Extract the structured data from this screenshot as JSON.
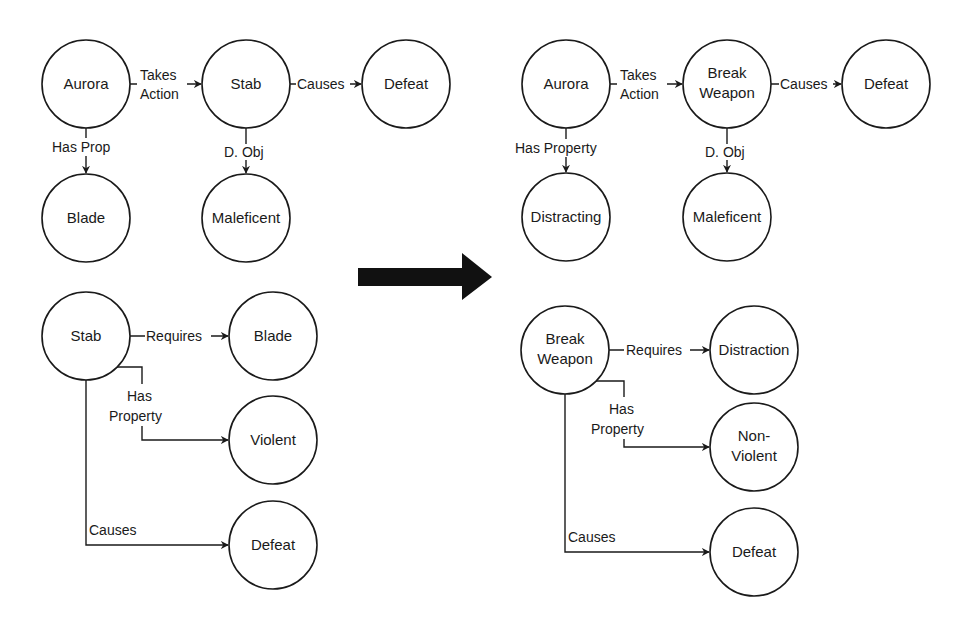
{
  "colors": {
    "stroke": "#1a1a1a",
    "background": "#ffffff",
    "arrow": "#111111"
  },
  "left_top": {
    "nodes": [
      {
        "id": "aurora",
        "label": "Aurora"
      },
      {
        "id": "stab",
        "label": "Stab"
      },
      {
        "id": "defeat",
        "label": "Defeat"
      },
      {
        "id": "blade",
        "label": "Blade"
      },
      {
        "id": "maleficent",
        "label": "Maleficent"
      }
    ],
    "edges": [
      {
        "from": "aurora",
        "to": "stab",
        "label_1": "Takes",
        "label_2": "Action"
      },
      {
        "from": "stab",
        "to": "defeat",
        "label": "Causes"
      },
      {
        "from": "aurora",
        "to": "blade",
        "label": "Has Prop"
      },
      {
        "from": "stab",
        "to": "maleficent",
        "label": "D. Obj"
      }
    ]
  },
  "left_bottom": {
    "nodes": [
      {
        "id": "stab",
        "label": "Stab"
      },
      {
        "id": "blade",
        "label": "Blade"
      },
      {
        "id": "violent",
        "label": "Violent"
      },
      {
        "id": "defeat",
        "label": "Defeat"
      }
    ],
    "edges": [
      {
        "from": "stab",
        "to": "blade",
        "label": "Requires"
      },
      {
        "from": "stab",
        "to": "violent",
        "label_1": "Has",
        "label_2": "Property"
      },
      {
        "from": "stab",
        "to": "defeat",
        "label": "Causes"
      }
    ]
  },
  "transform_arrow": {
    "icon": "right-arrow-icon"
  },
  "right_top": {
    "nodes": [
      {
        "id": "aurora",
        "label": "Aurora"
      },
      {
        "id": "break_weapon",
        "label_1": "Break",
        "label_2": "Weapon"
      },
      {
        "id": "defeat",
        "label": "Defeat"
      },
      {
        "id": "distracting",
        "label": "Distracting"
      },
      {
        "id": "maleficent",
        "label": "Maleficent"
      }
    ],
    "edges": [
      {
        "from": "aurora",
        "to": "break_weapon",
        "label_1": "Takes",
        "label_2": "Action"
      },
      {
        "from": "break_weapon",
        "to": "defeat",
        "label": "Causes"
      },
      {
        "from": "aurora",
        "to": "distracting",
        "label": "Has Property"
      },
      {
        "from": "break_weapon",
        "to": "maleficent",
        "label": "D. Obj"
      }
    ]
  },
  "right_bottom": {
    "nodes": [
      {
        "id": "break_weapon",
        "label_1": "Break",
        "label_2": "Weapon"
      },
      {
        "id": "distraction",
        "label": "Distraction"
      },
      {
        "id": "non_violent",
        "label_1": "Non-",
        "label_2": "Violent"
      },
      {
        "id": "defeat",
        "label": "Defeat"
      }
    ],
    "edges": [
      {
        "from": "break_weapon",
        "to": "distraction",
        "label": "Requires"
      },
      {
        "from": "break_weapon",
        "to": "non_violent",
        "label_1": "Has",
        "label_2": "Property"
      },
      {
        "from": "break_weapon",
        "to": "defeat",
        "label": "Causes"
      }
    ]
  }
}
